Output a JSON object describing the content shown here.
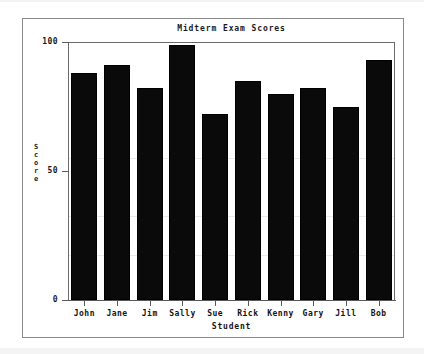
{
  "chart_data": {
    "type": "bar",
    "title": "Midterm Exam Scores",
    "xlabel": "Student",
    "ylabel": "Score",
    "categories": [
      "John",
      "Jane",
      "Jim",
      "Sally",
      "Sue",
      "Rick",
      "Kenny",
      "Gary",
      "Jill",
      "Bob"
    ],
    "values": [
      88,
      91,
      82,
      99,
      72,
      85,
      80,
      82,
      75,
      93
    ],
    "ylim": [
      0,
      100
    ],
    "ytick_labels": [
      "0",
      "50",
      "100"
    ],
    "ytick_values": [
      0,
      50,
      100
    ],
    "grid": false,
    "legend": false,
    "bar_color": "#0a0a0a",
    "axis_color": "#5a5a5a",
    "background_color": "#ffffff"
  },
  "figure": {
    "frame_color": "#8a8a8a"
  }
}
